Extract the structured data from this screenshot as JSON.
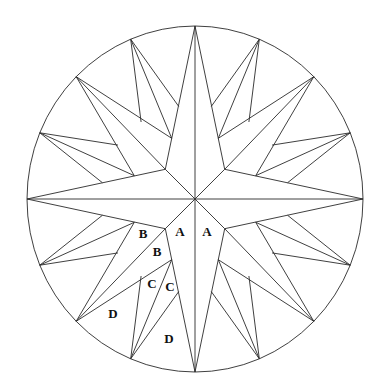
{
  "diagram": {
    "background_color": "#ffffff",
    "line_color": "#2a2a2a",
    "center": [
      195,
      199
    ],
    "radius_x": 168,
    "radius_y": 173,
    "main_arms": {
      "count": 4,
      "angles_deg": [
        0,
        90,
        180,
        270
      ],
      "waist_radius": 42
    },
    "diagonal_arms": {
      "count": 4,
      "angles_deg": [
        45,
        135,
        225,
        315
      ],
      "waist_offset_deg": 24,
      "waist_radius": 65
    },
    "tertiary_arms": {
      "count": 8,
      "angles_deg": [
        22.5,
        67.5,
        112.5,
        157.5,
        202.5,
        247.5,
        292.5,
        337.5
      ],
      "side_offset_deg": 12.5,
      "side_radius": 94
    },
    "piece_labels": [
      {
        "text": "A",
        "x": 180,
        "y": 233
      },
      {
        "text": "A",
        "x": 207,
        "y": 233
      },
      {
        "text": "B",
        "x": 143,
        "y": 235
      },
      {
        "text": "B",
        "x": 157,
        "y": 253
      },
      {
        "text": "C",
        "x": 152,
        "y": 285
      },
      {
        "text": "C",
        "x": 170,
        "y": 288
      },
      {
        "text": "D",
        "x": 113,
        "y": 315
      },
      {
        "text": "D",
        "x": 169,
        "y": 340
      }
    ]
  }
}
